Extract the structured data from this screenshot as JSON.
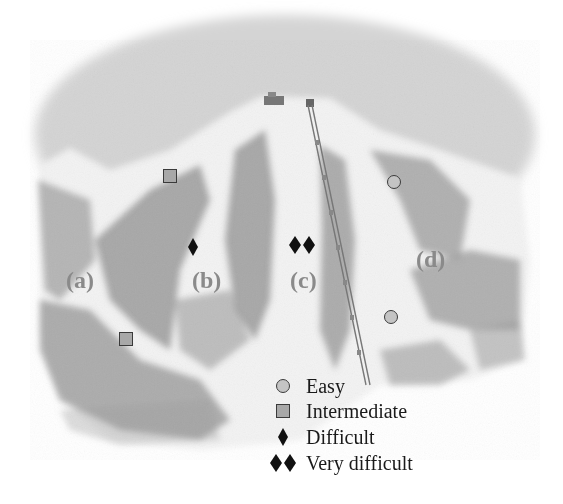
{
  "figure": {
    "type": "ski-trail-map-illustration",
    "trails": [
      {
        "id": "a",
        "label": "(a)",
        "difficulty": "Intermediate",
        "symbol": "square"
      },
      {
        "id": "b",
        "label": "(b)",
        "difficulty": "Difficult",
        "symbol": "diamond"
      },
      {
        "id": "c",
        "label": "(c)",
        "difficulty": "Very difficult",
        "symbol": "double-diamond"
      },
      {
        "id": "d",
        "label": "(d)",
        "difficulty": "Easy",
        "symbol": "circle"
      }
    ],
    "legend": {
      "items": [
        {
          "symbol": "circle",
          "label": "Easy"
        },
        {
          "symbol": "square",
          "label": "Intermediate"
        },
        {
          "symbol": "diamond",
          "label": "Difficult"
        },
        {
          "symbol": "double-diamond",
          "label": "Very difficult"
        }
      ]
    },
    "colors": {
      "sky": "#d6d6d6",
      "snow": "#f4f4f4",
      "trees": "#8c8c8c",
      "label_gray": "#8a8a8a",
      "marker_fill": "#b8b8b8",
      "marker_stroke": "#3a3a3a",
      "diamond": "#111111"
    }
  }
}
